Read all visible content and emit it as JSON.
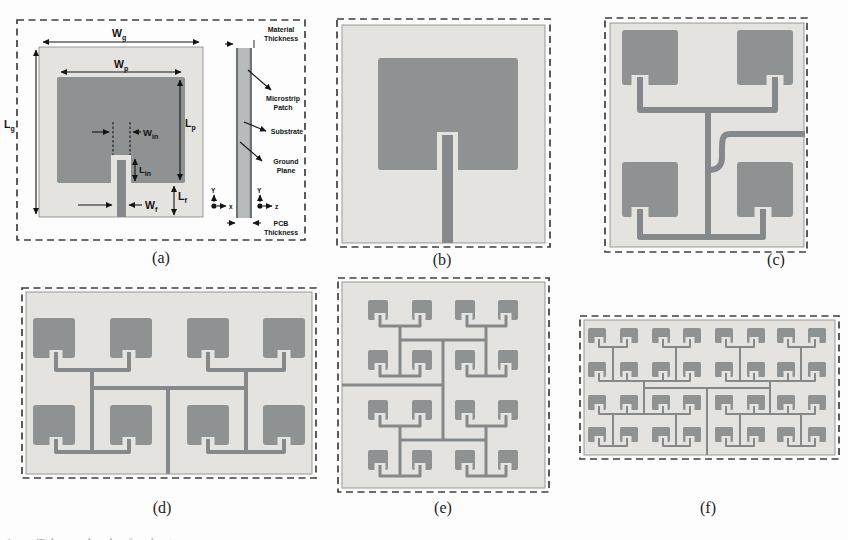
{
  "colors": {
    "substrate": "#e4e3e0",
    "patch": "#8e9293",
    "feed": "#85898b",
    "layer_dark": "#6e7376",
    "layer_mid": "#b7bbbc",
    "dash": "#3f3f3f",
    "ink": "#141414"
  },
  "captions": [
    {
      "label": "(a)"
    },
    {
      "label": "(b)"
    },
    {
      "label": "(c)"
    },
    {
      "label": "(d)"
    },
    {
      "label": "(e)"
    },
    {
      "label": "(f)"
    }
  ],
  "caption_fragment": "1. The  d        d     f        d          t",
  "panel_a": {
    "dims": {
      "wg": {
        "main": "W",
        "sub": "g"
      },
      "wp": {
        "main": "W",
        "sub": "p"
      },
      "lg": {
        "main": "L",
        "sub": "g"
      },
      "lp": {
        "main": "L",
        "sub": "p"
      },
      "win": {
        "main": "W",
        "sub": "in"
      },
      "lin": {
        "main": "L",
        "sub": "in"
      },
      "wf": {
        "main": "W",
        "sub": "f"
      },
      "lf": {
        "main": "L",
        "sub": "f"
      }
    },
    "legend": {
      "material": [
        "Material",
        "Thickness"
      ],
      "microstrip": [
        "Microstrip",
        "Patch"
      ],
      "substrate": [
        "Substrate"
      ],
      "ground": [
        "Ground",
        "Plane"
      ],
      "pcb": [
        "PCB",
        "Thickness"
      ]
    },
    "axes": {
      "y": "Y",
      "x": "x",
      "z": "z"
    }
  },
  "array_panels": [
    {
      "id": "b",
      "frame": [
        337,
        19,
        213,
        228
      ],
      "substrate": [
        342,
        25,
        203,
        218
      ],
      "patch": [
        378,
        58,
        140,
        112
      ],
      "notch": [
        437,
        132,
        21,
        38
      ],
      "feed": [
        442,
        135,
        11,
        108
      ]
    },
    {
      "id": "c",
      "frame": [
        605,
        18,
        202,
        234
      ],
      "substrate": [
        610,
        23,
        194,
        224
      ],
      "pw": 56,
      "ph": 55,
      "r": 3,
      "cols": [
        622,
        737
      ],
      "rows": [
        30,
        162
      ],
      "stroke": 6,
      "quads": [
        {
          "cx": 708,
          "trunk": [
            110,
            237
          ],
          "pairs": [
            {
              "busY": 110,
              "pb": 85,
              "stubs": [
                640,
                775
              ]
            },
            {
              "busY": 237,
              "pb": 217,
              "stubs": [
                640,
                763
              ]
            }
          ]
        }
      ],
      "paths": [
        "M805,134 H730 C722,134 722,140 722,150 V158 C722,166 717,170 709,170"
      ]
    },
    {
      "id": "d",
      "frame": [
        22,
        288,
        294,
        190
      ],
      "substrate": [
        26,
        292,
        286,
        182
      ],
      "pw": 42,
      "ph": 40,
      "r": 3,
      "cols": [
        33,
        110,
        187,
        263
      ],
      "rows": [
        318,
        405
      ],
      "stroke": 4,
      "quads": [
        {
          "cx": 92,
          "trunk": [
            370,
            452
          ],
          "pairs": [
            {
              "busY": 370,
              "pb": 358,
              "stubs": [
                56,
                129
              ]
            },
            {
              "busY": 452,
              "pb": 445,
              "stubs": [
                56,
                129
              ]
            }
          ]
        },
        {
          "cx": 246,
          "trunk": [
            370,
            452
          ],
          "pairs": [
            {
              "busY": 370,
              "pb": 358,
              "stubs": [
                208,
                284
              ]
            },
            {
              "busY": 452,
              "pb": 445,
              "stubs": [
                208,
                284
              ]
            }
          ]
        }
      ],
      "paths": [
        "M92,388 H246",
        "M168,388 V474"
      ]
    },
    {
      "id": "e",
      "frame": [
        338,
        278,
        211,
        214
      ],
      "substrate": [
        342,
        282,
        203,
        206
      ],
      "pw": 20,
      "ph": 20,
      "r": 2,
      "cols": [
        368,
        412,
        455,
        498
      ],
      "rows": [
        300,
        350,
        400,
        450
      ],
      "stroke": 3,
      "quads": [
        {
          "cx": 400,
          "trunk": [
            326,
            376
          ],
          "pairs": [
            {
              "busY": 326,
              "pb": 320,
              "stubs": [
                380,
                420
              ]
            },
            {
              "busY": 376,
              "pb": 370,
              "stubs": [
                380,
                420
              ]
            }
          ]
        },
        {
          "cx": 486,
          "trunk": [
            326,
            376
          ],
          "pairs": [
            {
              "busY": 326,
              "pb": 320,
              "stubs": [
                467,
                506
              ]
            },
            {
              "busY": 376,
              "pb": 370,
              "stubs": [
                467,
                506
              ]
            }
          ]
        },
        {
          "cx": 400,
          "trunk": [
            426,
            476
          ],
          "pairs": [
            {
              "busY": 426,
              "pb": 420,
              "stubs": [
                380,
                420
              ]
            },
            {
              "busY": 476,
              "pb": 470,
              "stubs": [
                380,
                420
              ]
            }
          ]
        },
        {
          "cx": 486,
          "trunk": [
            426,
            476
          ],
          "pairs": [
            {
              "busY": 426,
              "pb": 420,
              "stubs": [
                467,
                506
              ]
            },
            {
              "busY": 476,
              "pb": 470,
              "stubs": [
                467,
                506
              ]
            }
          ]
        }
      ],
      "paths": [
        "M400,340 H486",
        "M400,440 H486",
        "M443,340 V440",
        "M342,385 H443"
      ]
    },
    {
      "id": "f",
      "frame": [
        580,
        316,
        259,
        143
      ],
      "substrate": [
        584,
        320,
        251,
        135
      ],
      "pw": 18,
      "ph": 15,
      "r": 1.5,
      "cols": [
        588,
        620,
        652,
        683,
        715,
        747,
        777,
        808
      ],
      "rows": [
        328,
        362,
        395,
        427
      ],
      "stroke": 2,
      "quads": [
        {
          "cx": 613,
          "trunk": [
            347,
            381
          ],
          "pairs": [
            {
              "busY": 347,
              "pb": 343,
              "stubs": [
                599,
                627
              ]
            },
            {
              "busY": 381,
              "pb": 377,
              "stubs": [
                599,
                627
              ]
            }
          ]
        },
        {
          "cx": 676,
          "trunk": [
            347,
            381
          ],
          "pairs": [
            {
              "busY": 347,
              "pb": 343,
              "stubs": [
                663,
                690
              ]
            },
            {
              "busY": 381,
              "pb": 377,
              "stubs": [
                663,
                690
              ]
            }
          ]
        },
        {
          "cx": 740,
          "trunk": [
            347,
            381
          ],
          "pairs": [
            {
              "busY": 347,
              "pb": 343,
              "stubs": [
                726,
                754
              ]
            },
            {
              "busY": 381,
              "pb": 377,
              "stubs": [
                726,
                754
              ]
            }
          ]
        },
        {
          "cx": 801,
          "trunk": [
            347,
            381
          ],
          "pairs": [
            {
              "busY": 347,
              "pb": 343,
              "stubs": [
                788,
                815
              ]
            },
            {
              "busY": 381,
              "pb": 377,
              "stubs": [
                788,
                815
              ]
            }
          ]
        },
        {
          "cx": 613,
          "trunk": [
            414,
            446
          ],
          "pairs": [
            {
              "busY": 414,
              "pb": 410,
              "stubs": [
                599,
                627
              ]
            },
            {
              "busY": 446,
              "pb": 442,
              "stubs": [
                599,
                627
              ]
            }
          ]
        },
        {
          "cx": 676,
          "trunk": [
            414,
            446
          ],
          "pairs": [
            {
              "busY": 414,
              "pb": 410,
              "stubs": [
                663,
                690
              ]
            },
            {
              "busY": 446,
              "pb": 442,
              "stubs": [
                663,
                690
              ]
            }
          ]
        },
        {
          "cx": 740,
          "trunk": [
            414,
            446
          ],
          "pairs": [
            {
              "busY": 414,
              "pb": 410,
              "stubs": [
                726,
                754
              ]
            },
            {
              "busY": 446,
              "pb": 442,
              "stubs": [
                726,
                754
              ]
            }
          ]
        },
        {
          "cx": 801,
          "trunk": [
            414,
            446
          ],
          "pairs": [
            {
              "busY": 414,
              "pb": 410,
              "stubs": [
                788,
                815
              ]
            },
            {
              "busY": 446,
              "pb": 442,
              "stubs": [
                788,
                815
              ]
            }
          ]
        }
      ],
      "paths": [
        "M613,381 H676",
        "M613,414 H676",
        "M644,381 V414",
        "M740,381 H801",
        "M740,414 H801",
        "M770,381 V414",
        "M644,388 H770",
        "M707,388 V455"
      ]
    }
  ]
}
